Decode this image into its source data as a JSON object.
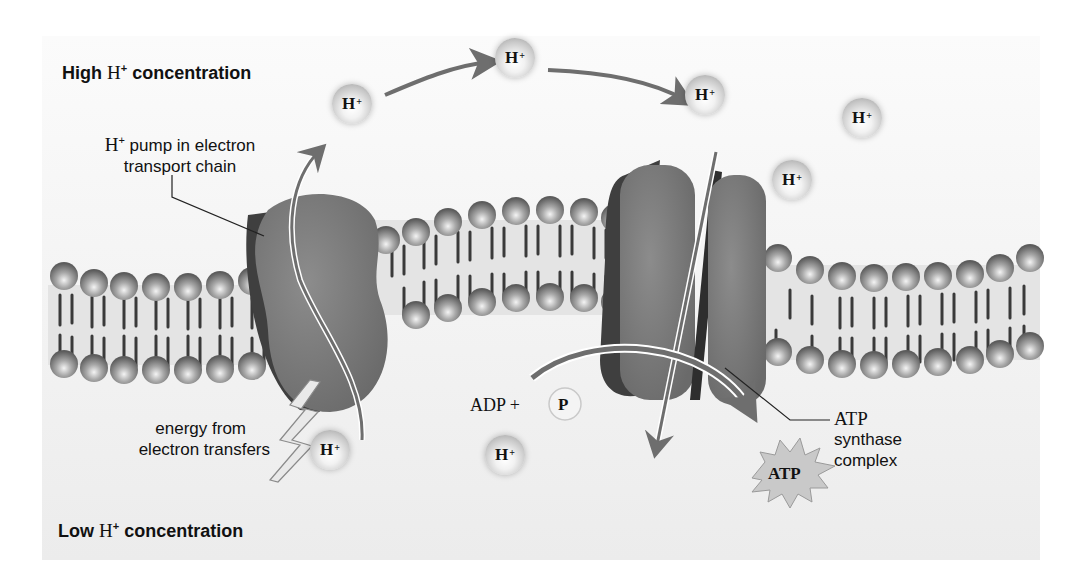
{
  "labels": {
    "high_concentration": {
      "prefix": "High ",
      "ion": "H",
      "charge": "+",
      "suffix": " concentration"
    },
    "low_concentration": {
      "prefix": "Low ",
      "ion": "H",
      "charge": "+",
      "suffix": " concentration"
    },
    "pump": {
      "line1_ion": "H",
      "line1_charge": "+",
      "line1_rest": " pump in electron",
      "line2": "transport chain"
    },
    "energy": {
      "line1": "energy from",
      "line2": "electron transfers"
    },
    "atp_synthase": {
      "line1": "ATP",
      "line2": "synthase",
      "line3": "complex"
    },
    "adp": "ADP +",
    "phosphate": "P",
    "atp": "ATP"
  },
  "ions": [
    {
      "symbol": "H",
      "charge": "+",
      "x": 352,
      "y": 104
    },
    {
      "symbol": "H",
      "charge": "+",
      "x": 515,
      "y": 58
    },
    {
      "symbol": "H",
      "charge": "+",
      "x": 705,
      "y": 95
    },
    {
      "symbol": "H",
      "charge": "+",
      "x": 862,
      "y": 118
    },
    {
      "symbol": "H",
      "charge": "+",
      "x": 792,
      "y": 180
    },
    {
      "symbol": "H",
      "charge": "+",
      "x": 330,
      "y": 450
    },
    {
      "symbol": "H",
      "charge": "+",
      "x": 505,
      "y": 455
    }
  ],
  "colors": {
    "panel_bg": "#f1f1f1",
    "protein": "#7d7d7d",
    "protein_dark": "#3f3f3f",
    "arrow": "#6e6e6e",
    "lipid_head": "#8a8a8a",
    "text": "#111111"
  }
}
